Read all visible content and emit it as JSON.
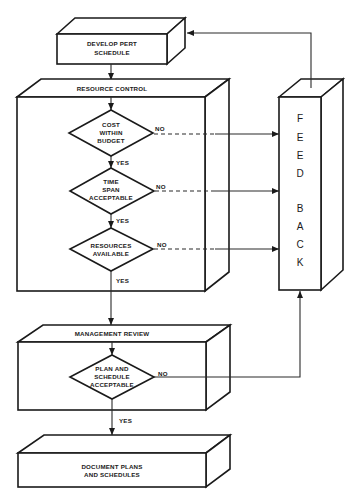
{
  "diagram": {
    "type": "flowchart",
    "boxes": {
      "develop_pert": {
        "lines": [
          "DEVELOP PERT",
          "SCHEDULE"
        ]
      },
      "resource_control": {
        "title": "RESOURCE    CONTROL"
      },
      "management_review": {
        "title": "MANAGEMENT    REVIEW"
      },
      "document_plans": {
        "lines": [
          "DOCUMENT PLANS",
          "AND SCHEDULES"
        ]
      },
      "feedback": {
        "letters": [
          "F",
          "E",
          "E",
          "D",
          "B",
          "A",
          "C",
          "K"
        ]
      }
    },
    "decisions": [
      {
        "lines": [
          "COST",
          "WITHIN",
          "BUDGET"
        ],
        "no_label": "NO",
        "yes_label": "YES"
      },
      {
        "lines": [
          "TIME",
          "SPAN",
          "ACCEPTABLE"
        ],
        "no_label": "NO",
        "yes_label": "YES"
      },
      {
        "lines": [
          "RESOURCES",
          "AVAILABLE"
        ],
        "no_label": "NO",
        "yes_label": "YES"
      },
      {
        "lines": [
          "PLAN AND",
          "SCHEDULE",
          "ACCEPTABLE"
        ],
        "no_label": "NO",
        "yes_label": "YES"
      }
    ]
  }
}
